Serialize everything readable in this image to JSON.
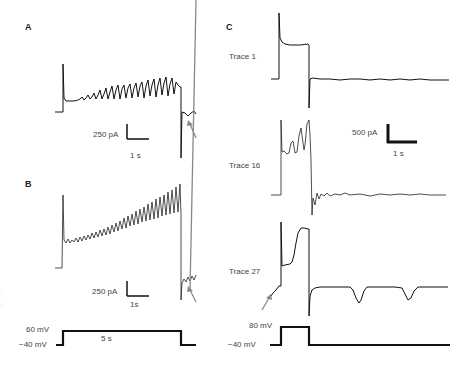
{
  "panels": {
    "A": {
      "label": "A",
      "scale_bar": {
        "current": "250 pA",
        "time": "1 s"
      }
    },
    "B": {
      "label": "B",
      "scale_bar": {
        "current": "250 pA",
        "time": "1s"
      },
      "command": {
        "high": "60 mV",
        "low": "−40 mV",
        "duration": "5 s"
      }
    },
    "C": {
      "label": "C",
      "traces": [
        {
          "name": "Trace 1"
        },
        {
          "name": "Trace 16"
        },
        {
          "name": "Trace 27"
        }
      ],
      "scale_bar": {
        "current": "500 pA",
        "time": "1 s"
      },
      "command": {
        "high": "80 mV",
        "low": "−40 mV"
      }
    }
  },
  "colors": {
    "trace": "#111111",
    "arrow": "#888888",
    "text": "#444444"
  }
}
